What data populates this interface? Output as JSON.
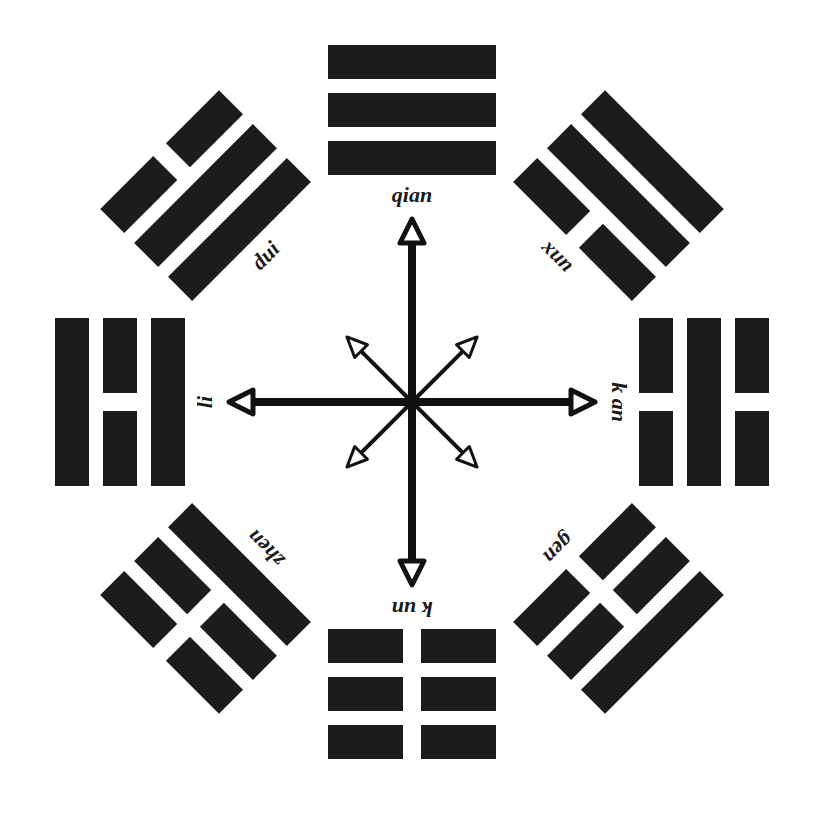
{
  "diagram": {
    "type": "bagua",
    "center": {
      "x": 412,
      "y": 402
    },
    "colors": {
      "bar": "#1c1c1c",
      "background": "#ffffff",
      "arrow": "#111111"
    },
    "trigrams": [
      {
        "name": "qian",
        "label": "qian",
        "angle": 0,
        "lines_inner_to_outer": [
          "solid",
          "solid",
          "solid"
        ]
      },
      {
        "name": "xun",
        "label": "xun",
        "angle": 45,
        "lines_inner_to_outer": [
          "broken",
          "solid",
          "solid"
        ]
      },
      {
        "name": "kan",
        "label": "k an",
        "angle": 90,
        "lines_inner_to_outer": [
          "broken",
          "solid",
          "broken"
        ]
      },
      {
        "name": "gen",
        "label": "gen",
        "angle": 135,
        "lines_inner_to_outer": [
          "broken",
          "broken",
          "solid"
        ]
      },
      {
        "name": "kun",
        "label": "k un",
        "angle": 180,
        "lines_inner_to_outer": [
          "broken",
          "broken",
          "broken"
        ]
      },
      {
        "name": "zhen",
        "label": "zhen",
        "angle": 225,
        "lines_inner_to_outer": [
          "solid",
          "broken",
          "broken"
        ]
      },
      {
        "name": "li",
        "label": "li",
        "angle": 270,
        "lines_inner_to_outer": [
          "solid",
          "broken",
          "solid"
        ]
      },
      {
        "name": "dui",
        "label": "dui",
        "angle": 315,
        "lines_inner_to_outer": [
          "solid",
          "solid",
          "broken"
        ]
      }
    ],
    "arrows": {
      "main": [
        0,
        90,
        180,
        270
      ],
      "diagonal": [
        45,
        135,
        225,
        315
      ]
    }
  }
}
